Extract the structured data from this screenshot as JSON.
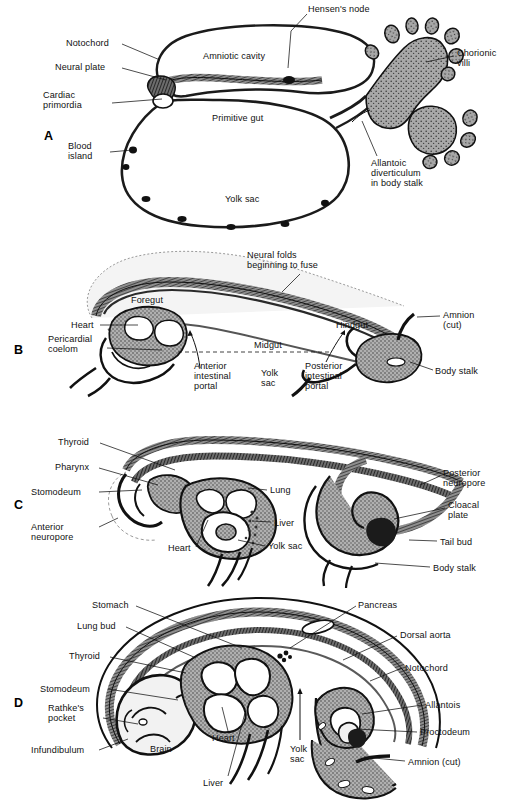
{
  "figure": {
    "background": "#ffffff",
    "ink": "#111111",
    "tissue_fill": "#9a9a9a",
    "cavity_fill": "#f2f2f2"
  },
  "panels": [
    {
      "letter": "A",
      "letter_x": 44,
      "letter_y": 129,
      "stage": "presomite embryo with amniotic cavity, primitive gut and yolk sac",
      "labels": [
        {
          "text": "Hensen's node",
          "x": 308,
          "y": 4,
          "align": "left",
          "lead": [
            [
              307,
              14
            ],
            [
              291,
              31
            ],
            [
              288,
              68
            ]
          ]
        },
        {
          "text": "Notochord",
          "x": 66,
          "y": 38,
          "align": "left",
          "lead": [
            [
              122,
              44
            ],
            [
              160,
              60
            ]
          ]
        },
        {
          "text": "Neural plate",
          "x": 55,
          "y": 62,
          "align": "left",
          "lead": [
            [
              122,
              68
            ],
            [
              166,
              80
            ]
          ]
        },
        {
          "text": "Cardiac\nprimordia",
          "x": 43,
          "y": 90,
          "align": "left",
          "lead": [
            [
              112,
              103
            ],
            [
              162,
              99
            ]
          ]
        },
        {
          "text": "Blood\nisland",
          "x": 68,
          "y": 141,
          "align": "left",
          "lead": [
            [
              110,
              152
            ],
            [
              132,
              150
            ]
          ]
        },
        {
          "text": "Amniotic cavity",
          "x": 203,
          "y": 51,
          "align": "left",
          "lead": null
        },
        {
          "text": "Primitive gut",
          "x": 212,
          "y": 113,
          "align": "left",
          "lead": null
        },
        {
          "text": "Yolk sac",
          "x": 225,
          "y": 194,
          "align": "left",
          "lead": null
        },
        {
          "text": "Chorionic\nvilli",
          "x": 457,
          "y": 48,
          "align": "left",
          "lead": [
            [
              454,
              56
            ],
            [
              426,
              62
            ]
          ]
        },
        {
          "text": "Allantoic\ndiverticulum\nin body stalk",
          "x": 371,
          "y": 158,
          "align": "left",
          "lead": [
            [
              377,
              156
            ],
            [
              362,
              121
            ]
          ]
        }
      ]
    },
    {
      "letter": "B",
      "letter_x": 14,
      "letter_y": 343,
      "stage": "embryo folding, neural folds fusing, fore- mid- and hindgut forming",
      "labels": [
        {
          "text": "Neural folds\nbeginning to fuse",
          "x": 247,
          "y": 250,
          "align": "left",
          "lead": [
            [
              300,
              274
            ],
            [
              282,
              292
            ]
          ]
        },
        {
          "text": "Foregut",
          "x": 131,
          "y": 295,
          "align": "left",
          "lead": null
        },
        {
          "text": "Heart",
          "x": 71,
          "y": 320,
          "align": "left",
          "lead": [
            [
              100,
              325
            ],
            [
              138,
              325
            ]
          ]
        },
        {
          "text": "Pericardial\ncoelom",
          "x": 48,
          "y": 334,
          "align": "left",
          "lead": [
            [
              107,
              348
            ],
            [
              162,
              350
            ]
          ]
        },
        {
          "text": "Anterior\nintestinal\nportal",
          "x": 194,
          "y": 361,
          "align": "left",
          "lead": null
        },
        {
          "text": "Midgut",
          "x": 254,
          "y": 340,
          "align": "left",
          "lead": null
        },
        {
          "text": "Yolk\nsac",
          "x": 261,
          "y": 368,
          "align": "left",
          "lead": null
        },
        {
          "text": "Posterior\nintestinal\nportal",
          "x": 305,
          "y": 361,
          "align": "left",
          "lead": null
        },
        {
          "text": "Hindgut",
          "x": 336,
          "y": 320,
          "align": "left",
          "lead": null
        },
        {
          "text": "Amnion\n(cut)",
          "x": 443,
          "y": 310,
          "align": "left",
          "lead": [
            [
              440,
              316
            ],
            [
              417,
              317
            ]
          ]
        },
        {
          "text": "Body stalk",
          "x": 435,
          "y": 366,
          "align": "left",
          "lead": [
            [
              433,
              370
            ],
            [
              410,
              362
            ]
          ]
        }
      ]
    },
    {
      "letter": "C",
      "letter_x": 14,
      "letter_y": 498,
      "stage": "embryo with pharynx, lung, liver and tail bud",
      "labels": [
        {
          "text": "Thyroid",
          "x": 58,
          "y": 437,
          "align": "left",
          "lead": [
            [
              100,
              443
            ],
            [
              175,
              470
            ]
          ]
        },
        {
          "text": "Pharynx",
          "x": 55,
          "y": 462,
          "align": "left",
          "lead": [
            [
              99,
              468
            ],
            [
              158,
              485
            ]
          ]
        },
        {
          "text": "Stomodeum",
          "x": 31,
          "y": 487,
          "align": "left",
          "lead": [
            [
              99,
              492
            ],
            [
              142,
              490
            ]
          ]
        },
        {
          "text": "Anterior\nneuropore",
          "x": 31,
          "y": 522,
          "align": "left",
          "lead": [
            [
              99,
              527
            ],
            [
              118,
              518
            ]
          ]
        },
        {
          "text": "Lung",
          "x": 270,
          "y": 485,
          "align": "left",
          "lead": [
            [
              267,
              490
            ],
            [
              248,
              488
            ]
          ]
        },
        {
          "text": "Liver",
          "x": 274,
          "y": 518,
          "align": "left",
          "lead": [
            [
              271,
              522
            ],
            [
              252,
              521
            ]
          ]
        },
        {
          "text": "Yolk sac",
          "x": 268,
          "y": 541,
          "align": "left",
          "lead": [
            [
              265,
              546
            ],
            [
              238,
              540
            ]
          ]
        },
        {
          "text": "Heart",
          "x": 168,
          "y": 543,
          "align": "left",
          "lead": [
            [
              196,
              547
            ],
            [
              208,
              520
            ]
          ]
        },
        {
          "text": "Posterior\nneuropore",
          "x": 443,
          "y": 468,
          "align": "left",
          "lead": [
            [
              440,
              476
            ],
            [
              420,
              485
            ]
          ]
        },
        {
          "text": "Cloacal\nplate",
          "x": 448,
          "y": 500,
          "align": "left",
          "lead": [
            [
              445,
              508
            ],
            [
              394,
              519
            ]
          ]
        },
        {
          "text": "Tail bud",
          "x": 440,
          "y": 537,
          "align": "left",
          "lead": [
            [
              437,
              541
            ],
            [
              409,
              540
            ]
          ]
        },
        {
          "text": "Body stalk",
          "x": 433,
          "y": 563,
          "align": "left",
          "lead": [
            [
              430,
              567
            ],
            [
              375,
              563
            ]
          ]
        }
      ]
    },
    {
      "letter": "D",
      "letter_x": 14,
      "letter_y": 696,
      "stage": "later embryo with brain, heart, liver, allantois and proctodeum",
      "labels": [
        {
          "text": "Stomach",
          "x": 92,
          "y": 600,
          "align": "left",
          "lead": [
            [
              136,
              606
            ],
            [
              242,
              648
            ]
          ]
        },
        {
          "text": "Lung bud",
          "x": 77,
          "y": 621,
          "align": "left",
          "lead": [
            [
              126,
              627
            ],
            [
              196,
              658
            ]
          ]
        },
        {
          "text": "Thyroid",
          "x": 69,
          "y": 651,
          "align": "left",
          "lead": [
            [
              110,
              657
            ],
            [
              186,
              673
            ]
          ]
        },
        {
          "text": "Stomodeum",
          "x": 40,
          "y": 684,
          "align": "left",
          "lead": [
            [
              108,
              689
            ],
            [
              178,
              700
            ]
          ]
        },
        {
          "text": "Rathke's\npocket",
          "x": 48,
          "y": 703,
          "align": "left",
          "lead": [
            [
              103,
              718
            ],
            [
              138,
              724
            ]
          ]
        },
        {
          "text": "Infundibulum",
          "x": 31,
          "y": 745,
          "align": "left",
          "lead": [
            [
              99,
              750
            ],
            [
              128,
              739
            ]
          ]
        },
        {
          "text": "Brain",
          "x": 150,
          "y": 744,
          "align": "left",
          "lead": null
        },
        {
          "text": "Heart",
          "x": 212,
          "y": 733,
          "align": "left",
          "lead": [
            [
              228,
              731
            ],
            [
              222,
              707
            ]
          ]
        },
        {
          "text": "Liver",
          "x": 203,
          "y": 778,
          "align": "left",
          "lead": [
            [
              228,
              776
            ],
            [
              245,
              713
            ]
          ]
        },
        {
          "text": "Yolk\nsac",
          "x": 290,
          "y": 744,
          "align": "left",
          "lead": null
        },
        {
          "text": "Pancreas",
          "x": 358,
          "y": 600,
          "align": "left",
          "lead": [
            [
              356,
              606
            ],
            [
              290,
              648
            ]
          ]
        },
        {
          "text": "Dorsal aorta",
          "x": 400,
          "y": 630,
          "align": "left",
          "lead": [
            [
              397,
              636
            ],
            [
              343,
              660
            ]
          ]
        },
        {
          "text": "Notochord",
          "x": 405,
          "y": 663,
          "align": "left",
          "lead": [
            [
              402,
              668
            ],
            [
              370,
              681
            ]
          ]
        },
        {
          "text": "Allantois",
          "x": 425,
          "y": 700,
          "align": "left",
          "lead": [
            [
              422,
              705
            ],
            [
              362,
              714
            ]
          ]
        },
        {
          "text": "Proctodeum",
          "x": 420,
          "y": 727,
          "align": "left",
          "lead": [
            [
              417,
              732
            ],
            [
              356,
              729
            ]
          ]
        },
        {
          "text": "Amnion (cut)",
          "x": 408,
          "y": 757,
          "align": "left",
          "lead": [
            [
              405,
              761
            ],
            [
              364,
              757
            ]
          ]
        }
      ]
    }
  ]
}
